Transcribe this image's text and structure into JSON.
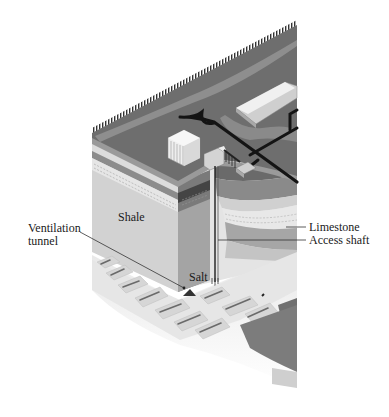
{
  "diagram": {
    "type": "cutaway-geologic-illustration",
    "labels": {
      "ventilation_tunnel_line1": "Ventilation",
      "ventilation_tunnel_line2": "tunnel",
      "shale": "Shale",
      "salt": "Salt",
      "limestone": "Limestone",
      "access_shaft": "Access shaft"
    },
    "colors": {
      "surface": "#6e6e6e",
      "surface_light": "#8c8c8c",
      "roads": "#141414",
      "buildings": "#e6e6e6",
      "shale": "#c8c8c8",
      "dark_band": "#5a5a5a",
      "mid_band": "#8a8a8a",
      "limestone": "#d6d6d6",
      "salt": "#eeeeee",
      "tunnel_floor": "#dadada",
      "leader_lines": "#333333"
    }
  }
}
